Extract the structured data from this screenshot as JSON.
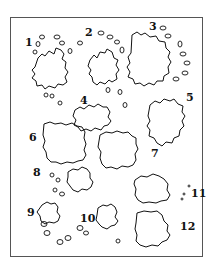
{
  "diagram": {
    "type": "numbered-region-map",
    "stroke_color": "#111111",
    "frame_color": "#555555",
    "labels": [
      {
        "id": "1",
        "text": "1",
        "x": 25,
        "y": 37
      },
      {
        "id": "2",
        "text": "2",
        "x": 85,
        "y": 27
      },
      {
        "id": "3",
        "text": "3",
        "x": 149,
        "y": 21
      },
      {
        "id": "4",
        "text": "4",
        "x": 80,
        "y": 95
      },
      {
        "id": "5",
        "text": "5",
        "x": 186,
        "y": 92
      },
      {
        "id": "6",
        "text": "6",
        "x": 29,
        "y": 132
      },
      {
        "id": "7",
        "text": "7",
        "x": 151,
        "y": 148
      },
      {
        "id": "8",
        "text": "8",
        "x": 33,
        "y": 167
      },
      {
        "id": "9",
        "text": "9",
        "x": 27,
        "y": 207
      },
      {
        "id": "10",
        "text": "10",
        "x": 80,
        "y": 213
      },
      {
        "id": "11",
        "text": "11",
        "x": 191,
        "y": 188
      },
      {
        "id": "12",
        "text": "12",
        "x": 180,
        "y": 221
      }
    ]
  }
}
